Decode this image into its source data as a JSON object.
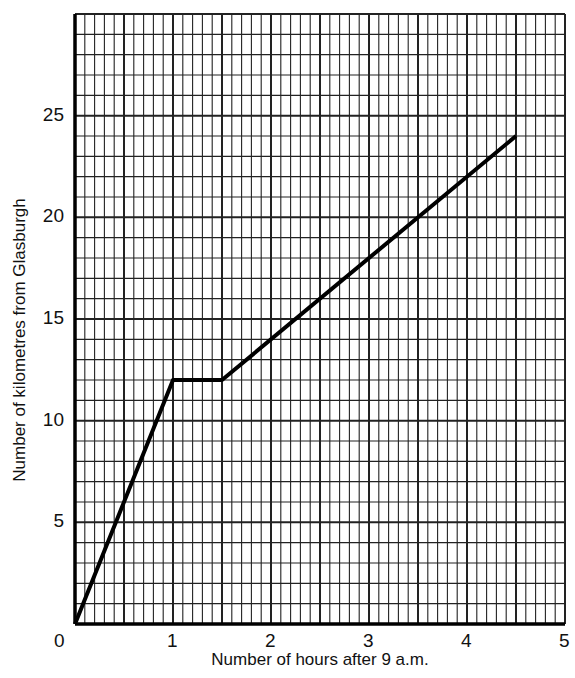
{
  "chart_data": {
    "type": "line",
    "title": "",
    "xlabel": "Number of hours after 9 a.m.",
    "ylabel": "Number of kilometres from Glasburgh",
    "x_ticks": [
      "0",
      "1",
      "2",
      "3",
      "4",
      "5"
    ],
    "y_ticks": [
      "5",
      "10",
      "15",
      "20",
      "25"
    ],
    "xlim": [
      0,
      5
    ],
    "ylim": [
      0,
      30
    ],
    "grid": true,
    "legend": null,
    "series": [
      {
        "name": "Distance from Glasburgh",
        "x": [
          0,
          1,
          1.5,
          4.5
        ],
        "y": [
          0,
          12,
          12,
          24
        ]
      }
    ]
  },
  "colors": {
    "grid": "#222222",
    "line": "#000000",
    "background": "#ffffff"
  }
}
